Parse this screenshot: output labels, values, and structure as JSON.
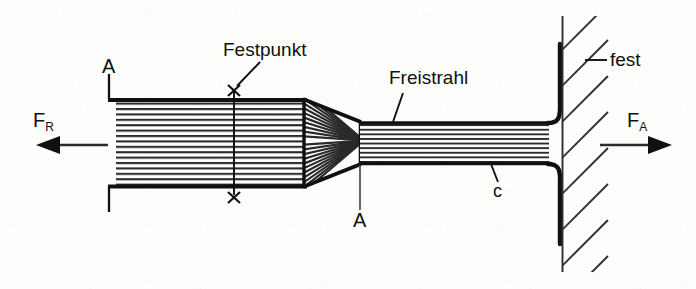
{
  "figure": {
    "type": "technical-diagram",
    "background_color": "#fdfdfc",
    "ink_color": "#101010",
    "width": 696,
    "height": 289
  },
  "labels": {
    "festpunkt": "Festpunkt",
    "freistrahl": "Freistrahl",
    "fest": "fest",
    "section_a_top": "A",
    "section_a_bottom": "A",
    "jet_c": "c",
    "force_left_symbol": "F",
    "force_left_subscript": "R",
    "force_right_symbol": "F",
    "force_right_subscript": "A"
  },
  "annotations": [
    {
      "name": "festpunkt-callout",
      "text": "Festpunkt",
      "target": "fixed-point crosses on chamber top and bottom walls",
      "marker": "x"
    },
    {
      "name": "freistrahl-callout",
      "text": "Freistrahl",
      "target": "free jet upper boundary"
    },
    {
      "name": "fest-callout",
      "text": "fest",
      "target": "fixed hatched wall"
    },
    {
      "name": "jet-velocity-callout",
      "text": "c",
      "target": "free jet lower boundary"
    },
    {
      "name": "section-line-a-a",
      "text": "A",
      "target": "section cut A-A at nozzle exit"
    }
  ],
  "forces": [
    {
      "name": "reaction-force",
      "label": "F",
      "subscript": "R",
      "direction": "left",
      "arrow": "left-arrow"
    },
    {
      "name": "impact-force",
      "label": "F",
      "subscript": "A",
      "direction": "right",
      "arrow": "right-arrow"
    }
  ],
  "geometry": {
    "chamber": {
      "name": "pressure-chamber",
      "x": 108,
      "y": 99,
      "width": 196,
      "height": 88,
      "fill": "horizontal-hatch"
    },
    "nozzle": {
      "name": "convergent-nozzle",
      "x_start": 304,
      "x_end": 360,
      "y_top_start": 99,
      "y_top_end": 122,
      "y_bot_start": 187,
      "y_bot_end": 164,
      "fill": "chevron-hatch"
    },
    "free_jet": {
      "name": "free-jet",
      "x": 360,
      "x_end": 548,
      "y_top": 122,
      "y_bot": 164,
      "fill": "horizontal-hatch"
    },
    "wall": {
      "name": "fixed-wall",
      "x": 562,
      "y_top": 16,
      "y_bot": 272,
      "hatch": "45-degree-up-right"
    },
    "deflector": {
      "name": "jet-deflector-plate",
      "x": 548,
      "y_top": 44,
      "y_bot": 244
    }
  }
}
